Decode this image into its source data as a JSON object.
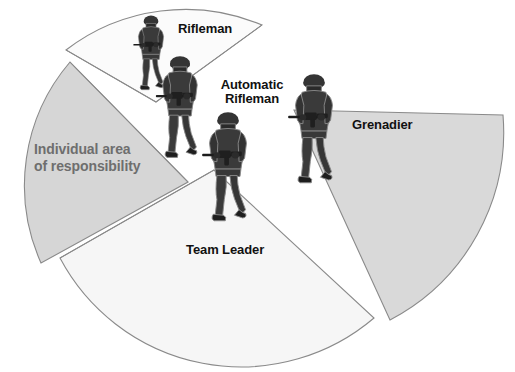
{
  "figure": {
    "kind": "fire-team-sector-diagram",
    "background_color": "#ffffff"
  },
  "chart_data": {
    "type": "pie",
    "title": "",
    "subtitle": "",
    "xlabel": "",
    "ylabel": "",
    "legend_position": "none",
    "grid": false,
    "note": "Exploded radial sector diagram: four fan-shaped sectors of fire radiating outward from a common fire-team center, each assigned to one fire-team member.",
    "center_x": 210,
    "center_y": 150,
    "categories": [
      "Rifleman",
      "Automatic Rifleman",
      "Grenadier",
      "Team Leader"
    ],
    "slices": [
      {
        "label": "Rifleman",
        "fill": "#fbfbfb",
        "start_angle_deg": 166,
        "end_angle_deg": 212,
        "span_deg": 46,
        "direction": "up-left",
        "radius_px": 200
      },
      {
        "label": "Automatic Rifleman",
        "fill": "#d6d6d6",
        "start_angle_deg": 214,
        "end_angle_deg": 296,
        "span_deg": 82,
        "direction": "left",
        "radius_px": 190,
        "contains_annotation": "Individual area of responsibility"
      },
      {
        "label": "Team Leader",
        "fill": "#f6f6f6",
        "start_angle_deg": 300,
        "end_angle_deg": 372,
        "span_deg": 72,
        "direction": "down",
        "radius_px": 205
      },
      {
        "label": "Grenadier",
        "fill": "#d9d9d9",
        "start_angle_deg": 8,
        "end_angle_deg": 82,
        "span_deg": 74,
        "direction": "right",
        "radius_px": 215
      }
    ],
    "values": [
      46,
      82,
      72,
      74
    ],
    "value_unit": "degrees of arc"
  },
  "labels": {
    "rifleman": "Rifleman",
    "automatic_rifleman_line1": "Automatic",
    "automatic_rifleman_line2": "Rifleman",
    "grenadier": "Grenadier",
    "team_leader": "Team Leader",
    "individual_area_line1": "Individual area",
    "individual_area_line2": "of responsibility"
  },
  "colors": {
    "sector_gray": "#d6d6d6",
    "sector_light_gray": "#f6f6f6",
    "sector_near_white": "#fbfbfb",
    "sector_outline": "#8a8a8a",
    "label_text": "#111111",
    "annotation_text": "#6e6e6e",
    "soldier_dark": "#2f2f2f",
    "soldier_mid": "#555555"
  },
  "soldiers": [
    {
      "name": "soldier-rifleman",
      "role": "Rifleman",
      "x": 124,
      "y": 14,
      "width": 54,
      "height": 82
    },
    {
      "name": "soldier-automatic-rifleman",
      "role": "Automatic Rifleman",
      "x": 152,
      "y": 54,
      "width": 56,
      "height": 112
    },
    {
      "name": "soldier-team-leader",
      "role": "Team Leader",
      "x": 200,
      "y": 110,
      "width": 56,
      "height": 120
    },
    {
      "name": "soldier-grenadier",
      "role": "Grenadier",
      "x": 285,
      "y": 72,
      "width": 58,
      "height": 120
    }
  ]
}
